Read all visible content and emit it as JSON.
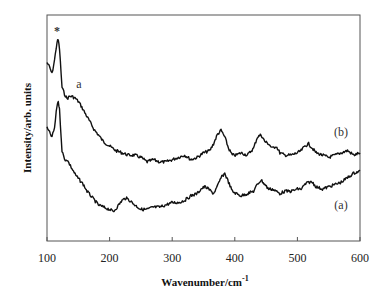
{
  "chart_data": {
    "type": "line",
    "title": "",
    "xlabel": "Wavenumber/cm",
    "xlabel_superscript": "-1",
    "ylabel": "Intensity/arb. units",
    "xlim": [
      100,
      600
    ],
    "ylim": [
      0,
      100
    ],
    "xticks": [
      100,
      200,
      300,
      400,
      500,
      600
    ],
    "yticks": [],
    "grid": false,
    "legend": "none (inline curve labels)",
    "series": [
      {
        "name": "(b)",
        "label_pos": [
          558,
          48
        ],
        "x": [
          100,
          104,
          108,
          112,
          116,
          118,
          120,
          124,
          128,
          132,
          136,
          140,
          146,
          152,
          158,
          164,
          170,
          176,
          182,
          190,
          200,
          210,
          220,
          230,
          240,
          250,
          260,
          270,
          280,
          290,
          300,
          310,
          320,
          330,
          340,
          350,
          360,
          366,
          372,
          378,
          384,
          390,
          396,
          402,
          410,
          420,
          430,
          436,
          442,
          448,
          454,
          460,
          466,
          472,
          480,
          490,
          500,
          506,
          512,
          518,
          524,
          530,
          540,
          550,
          560,
          570,
          580,
          590,
          600
        ],
        "y": [
          79,
          77,
          74,
          80,
          88,
          89,
          85,
          68,
          65,
          63,
          64,
          64,
          63,
          61,
          58,
          55,
          52,
          49,
          47,
          44,
          42,
          40,
          39,
          38,
          38,
          37,
          35,
          36,
          35,
          35,
          36,
          37,
          38,
          36,
          37,
          39,
          40,
          43,
          47,
          49,
          46,
          41,
          38,
          38,
          39,
          38,
          41,
          46,
          47,
          44,
          43,
          41,
          42,
          39,
          38,
          38,
          39,
          40,
          42,
          43,
          41,
          39,
          38,
          37,
          38,
          39,
          40,
          38,
          39
        ]
      },
      {
        "name": "(a)",
        "label_pos": [
          558,
          18
        ],
        "x": [
          100,
          104,
          108,
          112,
          116,
          118,
          120,
          124,
          128,
          132,
          136,
          140,
          146,
          152,
          158,
          164,
          170,
          176,
          182,
          190,
          200,
          206,
          212,
          220,
          226,
          232,
          240,
          250,
          260,
          270,
          280,
          290,
          300,
          310,
          320,
          330,
          340,
          346,
          352,
          358,
          366,
          372,
          378,
          384,
          390,
          396,
          402,
          410,
          420,
          430,
          436,
          442,
          448,
          454,
          460,
          466,
          472,
          480,
          490,
          500,
          506,
          512,
          518,
          524,
          530,
          540,
          550,
          560,
          570,
          580,
          590,
          600
        ],
        "y": [
          50,
          48,
          46,
          50,
          60,
          62,
          58,
          40,
          36,
          36,
          34,
          32,
          29,
          27,
          25,
          22,
          20,
          18,
          16,
          15,
          14,
          13,
          15,
          18,
          19,
          18,
          16,
          14,
          14,
          15,
          15,
          16,
          17,
          17,
          18,
          20,
          21,
          23,
          24,
          23,
          21,
          24,
          28,
          30,
          26,
          22,
          21,
          20,
          21,
          22,
          25,
          27,
          25,
          23,
          23,
          22,
          21,
          22,
          22,
          23,
          23,
          25,
          26,
          26,
          24,
          23,
          24,
          25,
          26,
          28,
          30,
          31
        ]
      }
    ],
    "annotations": [
      {
        "text": "*",
        "x": 117,
        "y": 97
      },
      {
        "text": "a",
        "x": 150,
        "y": 74
      },
      {
        "text": "(b)",
        "x": 558,
        "y": 48
      },
      {
        "text": "(a)",
        "x": 558,
        "y": 18
      }
    ]
  },
  "labels": {
    "xlabel": "Wavenumber/cm",
    "xlabel_sup": "-1",
    "ylabel": "Intensity/arb. units",
    "star": "*",
    "peak_a": "a",
    "curve_b": "(b)",
    "curve_a": "(a)",
    "xticks": [
      "100",
      "200",
      "300",
      "400",
      "500",
      "600"
    ]
  }
}
